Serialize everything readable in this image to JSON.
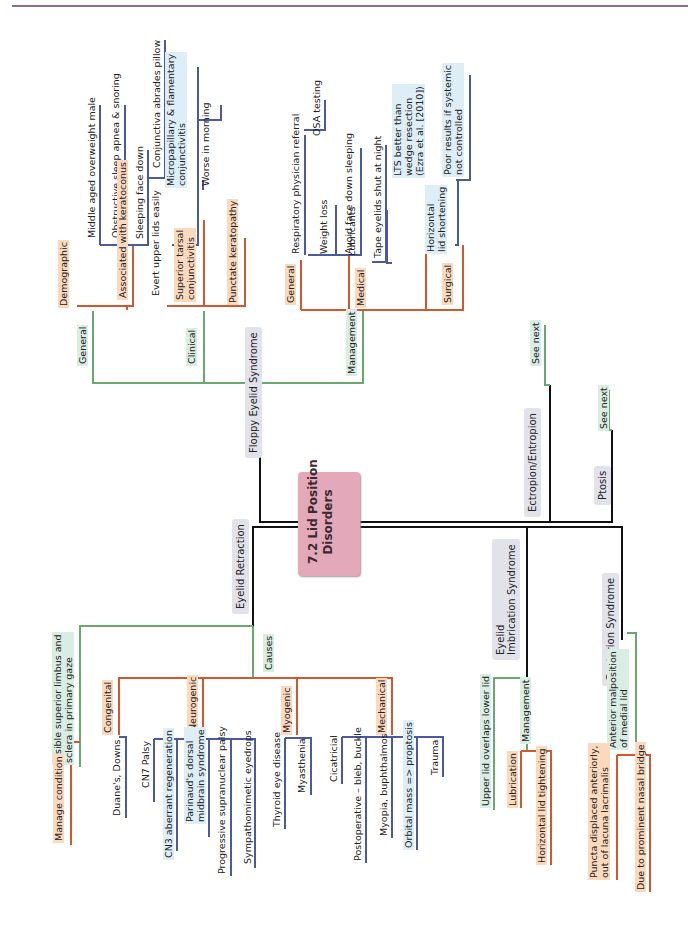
{
  "page": {
    "top_rule_color": "#8c6f8f"
  },
  "colors": {
    "root": "#e3a9ba",
    "level1": "#e2e3ea",
    "green": "#6aa870",
    "orange": "#d2572c",
    "blue": "#4b5aa0",
    "trunk": "#111111"
  },
  "root": {
    "label": "7.2 Lid Position\nDisorders"
  },
  "floppy": {
    "label": "Floppy Eyelid Syndrome",
    "general": {
      "label": "General",
      "demographic": {
        "label": "Demographic",
        "items": [
          "Middle aged overweight male",
          "Obstructive sleep apnea & snoring",
          "Sleeping face down",
          "Conjunctiva abrades pillow"
        ]
      },
      "associated": "Associated with keratoconus"
    },
    "clinical": {
      "label": "Clinical",
      "evert": "Evert upper lids easily",
      "superior": "Superior tarsal\nconjunctivitis",
      "micro": "Micropapillary & flamentary\nconjunctivitis",
      "worse": "Worse in morning",
      "punctate": "Punctate keratopathy"
    },
    "management": {
      "label": "Management",
      "general": {
        "label": "General",
        "resp": "Respiratory physician referral",
        "osa": "OSA testing",
        "weight": "Weight loss",
        "avoid": "Avoid face down sleeping"
      },
      "medical": {
        "label": "Medical",
        "lubricants": "Lubricants",
        "tape": "Tape eyelids shut at night"
      },
      "surgical": {
        "label": "Surgical",
        "hls": "Horizontal\nlid shortening",
        "lts": "LTS better than\nwedge resection\n(Ezra et al. [2010])",
        "poor": "Poor results if systemic\nnot controlled"
      }
    }
  },
  "ectropion": {
    "label": "Ectropion/Entropion",
    "see_next": "See next"
  },
  "ptosis": {
    "label": "Ptosis",
    "see_next": "See next"
  },
  "retraction": {
    "label": "Eyelid Retraction",
    "visible": "Visible superior limbus and\nsclera in primary gaze",
    "manage": "Manage condition",
    "causes": {
      "label": "Causes",
      "congenital": {
        "label": "Congenital",
        "items": [
          "Duane's, Downs"
        ]
      },
      "neurogenic": {
        "label": "Neurogenic",
        "items": [
          "CN7 Palsy",
          "CN3 aberrant regeneration",
          "Parinaud's dorsal\nmidbrain syndrome",
          "Progressive supranuclear palsy",
          "Sympathomimetic eyedrops"
        ]
      },
      "myogenic": {
        "label": "Myogenic",
        "items": [
          "Thyroid eye disease",
          "Myasthenia"
        ]
      },
      "mechanical": {
        "label": "Mechanical",
        "items": [
          "Cicatricial",
          "Postoperative – bleb, buckle",
          "Myopia, buphthalmos",
          "Orbital mass => proptosis",
          "Trauma"
        ]
      }
    }
  },
  "imbrication": {
    "label": "Eyelid\nImbrication Syndrome",
    "upper": "Upper lid overlaps lower lid",
    "management": "Management",
    "lubrication": "Lubrication",
    "hlt": "Horizontal lid tightening"
  },
  "centurion": {
    "label": "Centurion Syndrome",
    "anterior": "Anterior malposition\nof medial lid",
    "puncta": "Puncta displaced anteriorly,\nout of lacuna lacrimalis",
    "nasal": "Due to prominent nasal bridge"
  }
}
